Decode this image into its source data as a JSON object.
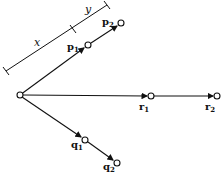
{
  "diagram": {
    "nodes": [
      {
        "id": "origin",
        "label": "",
        "x": 20,
        "y": 95
      },
      {
        "id": "p1",
        "label": "p",
        "sub": "1",
        "x": 88,
        "y": 45
      },
      {
        "id": "p2",
        "label": "p",
        "sub": "2",
        "x": 121,
        "y": 23
      },
      {
        "id": "r1",
        "label": "r",
        "sub": "1",
        "x": 151,
        "y": 96
      },
      {
        "id": "r2",
        "label": "r",
        "sub": "2",
        "x": 217,
        "y": 96
      },
      {
        "id": "q1",
        "label": "q",
        "sub": "1",
        "x": 85,
        "y": 140
      },
      {
        "id": "q2",
        "label": "q",
        "sub": "2",
        "x": 117,
        "y": 163
      }
    ],
    "edges": [
      {
        "from": "origin",
        "to": "p1"
      },
      {
        "from": "p1",
        "to": "p2"
      },
      {
        "from": "origin",
        "to": "r1"
      },
      {
        "from": "r1",
        "to": "r2"
      },
      {
        "from": "origin",
        "to": "q1"
      },
      {
        "from": "q1",
        "to": "q2"
      }
    ],
    "measure": {
      "x_label": "x",
      "y_label": "y"
    }
  }
}
